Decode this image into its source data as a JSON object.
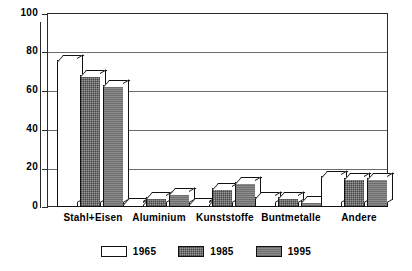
{
  "chart_data": {
    "type": "bar",
    "title": "",
    "subtitle": "",
    "xlabel": "",
    "ylabel": "",
    "ylim": [
      0,
      100
    ],
    "yticks": [
      0,
      20,
      40,
      60,
      80,
      100
    ],
    "grid": true,
    "legend_position": "bottom",
    "orientation": "vertical",
    "style": "3d-bar",
    "categories": [
      "Stahl+Eisen",
      "Aluminium",
      "Kunststoffe",
      "Buntmetalle",
      "Andere"
    ],
    "series": [
      {
        "name": "1965",
        "color": "#ffffff",
        "values": [
          76,
          2,
          2,
          5,
          16
        ]
      },
      {
        "name": "1985",
        "color": "#9a9a9a",
        "values": [
          68,
          5,
          10,
          5,
          15
        ]
      },
      {
        "name": "1995",
        "color": "#8d8d8d",
        "values": [
          63,
          7,
          13,
          3,
          15
        ]
      }
    ],
    "annotations": []
  },
  "axis": {
    "y_tick_labels": [
      "100",
      "80",
      "60",
      "40",
      "20",
      "0"
    ]
  },
  "legend": {
    "items": [
      {
        "label": "1965",
        "swatch": "legend-swatch-1965"
      },
      {
        "label": "1985",
        "swatch": "legend-swatch-1985"
      },
      {
        "label": "1995",
        "swatch": "legend-swatch-1995"
      }
    ]
  }
}
